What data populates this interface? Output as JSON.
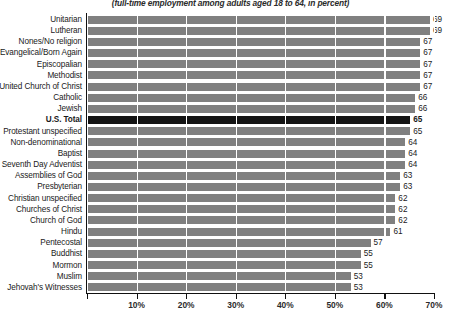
{
  "chart_data": {
    "type": "bar",
    "orientation": "horizontal",
    "title": "",
    "subtitle": "(full-time employment among adults aged 18 to 64, in percent)",
    "xlabel": "",
    "ylabel": "",
    "xlim": [
      0,
      70
    ],
    "grid": true,
    "legend": null,
    "xticks": [
      0,
      10,
      20,
      30,
      40,
      50,
      60,
      70
    ],
    "xtick_labels": [
      "",
      "10%",
      "20%",
      "30%",
      "40%",
      "50%",
      "60%",
      "70%"
    ],
    "highlight_category": "U.S. Total",
    "colors": {
      "bar": "#808080",
      "bar_highlight": "#141414",
      "gridline": "#ffffff",
      "axis": "#111111",
      "text": "#1a1a1a",
      "background": "#ffffff"
    },
    "categories": [
      "Unitarian",
      "Lutheran",
      "Nones/No religion",
      "Evangelical/Born Again",
      "Episcopalian",
      "Methodist",
      "United Church of Christ",
      "Catholic",
      "Jewish",
      "U.S. Total",
      "Protestant unspecified",
      "Non-denominational",
      "Baptist",
      "Seventh Day Adventist",
      "Assemblies of God",
      "Presbyterian",
      "Christian unspecified",
      "Churches of Christ",
      "Church of God",
      "Hindu",
      "Pentecostal",
      "Buddhist",
      "Mormon",
      "Muslim",
      "Jehovah's Witnesses"
    ],
    "values": [
      69,
      69,
      67,
      67,
      67,
      67,
      67,
      66,
      66,
      65,
      65,
      64,
      64,
      64,
      63,
      63,
      62,
      62,
      62,
      61,
      57,
      55,
      55,
      53,
      53
    ],
    "value_labels": [
      "69",
      "69",
      "67",
      "67",
      "67",
      "67",
      "67",
      "66",
      "66",
      "65",
      "65",
      "64",
      "64",
      "64",
      "63",
      "63",
      "62",
      "62",
      "62",
      "61",
      "57",
      "55",
      "55",
      "53",
      "53"
    ]
  }
}
